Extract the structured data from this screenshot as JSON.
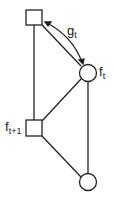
{
  "nodes": [
    {
      "id": "top-square",
      "shape": "square",
      "label": ""
    },
    {
      "id": "ft-circle",
      "shape": "circle",
      "label": "f",
      "sub": "t"
    },
    {
      "id": "ft1-square",
      "shape": "square",
      "label": "f",
      "sub": "t+1"
    },
    {
      "id": "bottom-circle",
      "shape": "circle",
      "label": ""
    }
  ],
  "edge_label": {
    "text": "g",
    "sub": "t"
  },
  "colors": {
    "stroke": "#222222",
    "background": "#ffffff"
  }
}
